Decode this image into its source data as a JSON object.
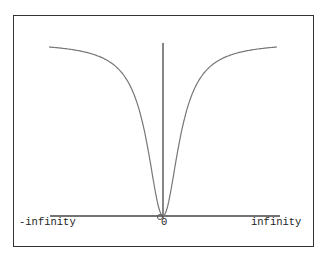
{
  "diagram": {
    "type": "function-plot",
    "function": "y = x^2 / (1 + x^2)",
    "labels": {
      "left": "-infinity",
      "origin": "0",
      "right": "infinity"
    },
    "colors": {
      "frame": "#333333",
      "axes": "#444444",
      "curve": "#777777",
      "text": "#222222"
    }
  }
}
